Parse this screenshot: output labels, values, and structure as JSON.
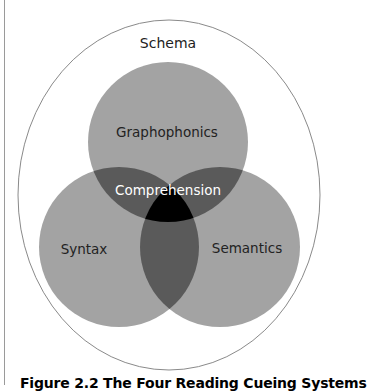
{
  "diagram": {
    "type": "venn",
    "outer_label": "Schema",
    "circles": [
      {
        "label": "Graphophonics",
        "cx": 168,
        "cy": 142,
        "r": 80
      },
      {
        "label": "Syntax",
        "cx": 119,
        "cy": 247,
        "r": 80
      },
      {
        "label": "Semantics",
        "cx": 220,
        "cy": 247,
        "r": 80
      }
    ],
    "center_label": "Comprehension",
    "outer_ellipse": {
      "cx": 169,
      "cy": 195,
      "rx": 151,
      "ry": 175
    },
    "colors": {
      "single": "#a3a3a3",
      "pair": "#5a5a5a",
      "triple": "#000000",
      "outer_stroke": "#8a8a8a",
      "text_dark": "#222222",
      "text_light": "#ffffff"
    }
  },
  "caption": "Figure 2.2 The Four Reading Cueing Systems"
}
